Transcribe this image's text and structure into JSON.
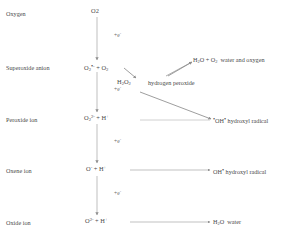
{
  "diagram": {
    "axis": {
      "name": "electron-addition-axis",
      "electron_label": "+e",
      "electron_charge": "-",
      "steps": 4
    },
    "rows": [
      {
        "id": "oxygen",
        "label": "Oxygen",
        "species_main": "O",
        "species_sub": "2",
        "species_charge": "",
        "species_dot": "",
        "species_extra": ""
      },
      {
        "id": "superoxide-anion",
        "label": "Superoxide anion",
        "species_main": "O",
        "species_sub": "2",
        "species_dot": "•",
        "species_charge": "-",
        "species_extra": "+ O",
        "species_extra_sub": "2"
      },
      {
        "id": "peroxide-ion",
        "label": "Peroxide ion",
        "species_main": "O",
        "species_sub": "2",
        "species_charge": "2-",
        "species_dot": "",
        "species_extra": "+  H",
        "species_extra_sup": "+"
      },
      {
        "id": "oxene-ion",
        "label": "Oxene ion",
        "species_main": "O",
        "species_sub": "",
        "species_charge": "-",
        "species_dot": "",
        "species_extra": "+  H",
        "species_extra_sup": "+"
      },
      {
        "id": "oxide-ion",
        "label": "Oxide ion",
        "species_main": "O",
        "species_sub": "",
        "species_charge": "2-",
        "species_dot": "",
        "species_extra": "+  H",
        "species_extra_sup": "+"
      }
    ],
    "intermediate": {
      "id": "hydrogen-peroxide",
      "formula_main": "H",
      "formula_sub1": "2",
      "formula_mid": "O",
      "formula_sub2": "2",
      "name": "hydrogen peroxide"
    },
    "products": [
      {
        "id": "water-and-oxygen",
        "formula_a": "H",
        "formula_a_sub": "2",
        "formula_b": "O + O",
        "formula_b_sub": "2",
        "name": "water and oxygen"
      },
      {
        "id": "hydroxyl-radical-peroxide",
        "formula": "OH",
        "dot": "•",
        "lead_dot": "•",
        "name": "hydroxyl radical"
      },
      {
        "id": "hydroxyl-radical-oxene",
        "formula": "OH",
        "dot": "•",
        "lead_dot": "",
        "name": "hydroxyl radical"
      },
      {
        "id": "water",
        "formula_main": "H",
        "formula_sub": "2",
        "formula_rest": "O",
        "name": "water"
      }
    ],
    "colors": {
      "line": "#9a9a9a",
      "text": "#4a4a4a",
      "background": "#ffffff"
    }
  }
}
